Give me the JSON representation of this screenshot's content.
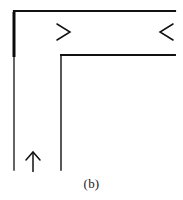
{
  "figure": {
    "caption": "(b)",
    "kind": "line-diagram",
    "canvas": {
      "width": 183,
      "height": 200
    },
    "colors": {
      "background": "#ffffff",
      "stroke": "#111111",
      "stroke_accent": "#0b0b0b",
      "caption": "#1a1a1a"
    },
    "strokes": {
      "outer_wall_width": 2.2,
      "outer_wall_thick_width": 3.0,
      "inner_wall_width": 1.6,
      "thin_wall_width": 1.2,
      "arrow_width": 1.4
    },
    "walls": [
      {
        "name": "outer-wall",
        "label": "outer duct wall",
        "points": "14,11 175,11"
      },
      {
        "name": "outer-wall-vertical",
        "label": "outer duct wall vertical leg",
        "points": "14,11 14,170"
      },
      {
        "name": "outer-wall-vertical-thick",
        "label": "outer wall thickened upper segment",
        "points": "14,12 14,57"
      },
      {
        "name": "inner-wall-horizontal",
        "label": "inner duct wall top",
        "points": "61,55 175,55"
      },
      {
        "name": "inner-wall-vertical",
        "label": "inner duct wall vertical leg",
        "points": "61,55 61,170"
      }
    ],
    "arrows": [
      {
        "name": "arrow-inlet-right",
        "direction": "right",
        "label": "flow entering from left",
        "head": "57,24 70,32 57,40",
        "x": 57,
        "y": 32
      },
      {
        "name": "arrow-inlet-left",
        "direction": "left",
        "label": "flow entering from right",
        "head": "173,24 160,32 173,40",
        "x": 160,
        "y": 32
      },
      {
        "name": "arrow-outlet-up",
        "direction": "up",
        "label": "flow exiting upward",
        "head": "26,160 33,152 40,160",
        "stem": "33,152 33,172",
        "x": 33,
        "y": 152
      }
    ]
  }
}
